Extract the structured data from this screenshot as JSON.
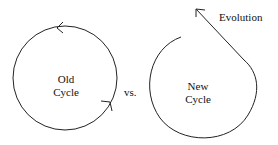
{
  "diagram": {
    "old_cycle": {
      "line1": "Old",
      "line2": "Cycle"
    },
    "versus": "vs.",
    "new_cycle": {
      "line1": "New",
      "line2": "Cycle"
    },
    "evolution": "Evolution"
  }
}
